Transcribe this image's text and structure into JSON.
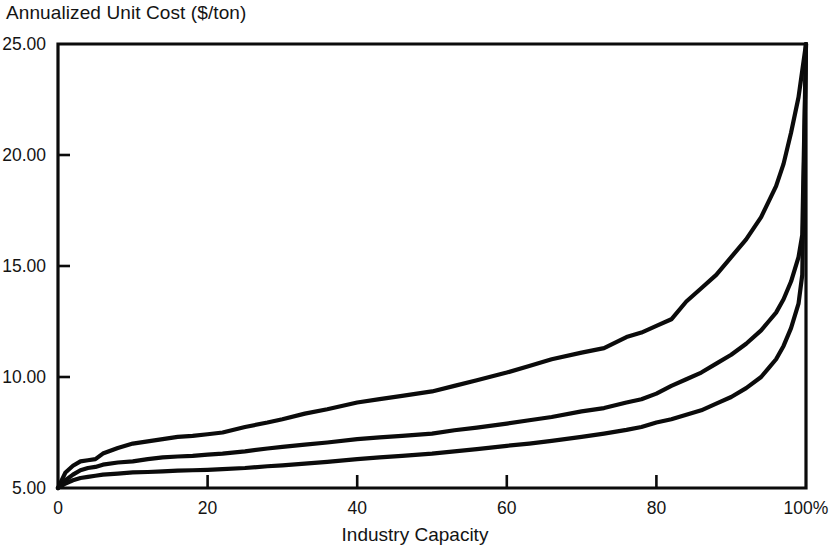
{
  "chart_data": {
    "type": "line",
    "title": "Annualized Unit Cost ($/ton)",
    "xlabel": "Industry Capacity",
    "ylabel": "Annualized Unit Cost ($/ton)",
    "xlim": [
      0,
      100
    ],
    "ylim": [
      5.0,
      25.0
    ],
    "grid": false,
    "legend_position": "none",
    "x_tick_labels": [
      "0",
      "20",
      "40",
      "60",
      "80",
      "100%"
    ],
    "x_tick_values": [
      0,
      20,
      40,
      60,
      80,
      100
    ],
    "y_tick_labels": [
      "5.00",
      "10.00",
      "15.00",
      "20.00",
      "25.00"
    ],
    "y_tick_values": [
      5.0,
      10.0,
      15.0,
      20.0,
      25.0
    ],
    "x": [
      0,
      1,
      2,
      3,
      4,
      5,
      6,
      8,
      10,
      12,
      14,
      16,
      18,
      20,
      22,
      25,
      28,
      30,
      33,
      36,
      40,
      43,
      46,
      50,
      53,
      56,
      60,
      63,
      66,
      70,
      73,
      76,
      78,
      80,
      82,
      84,
      86,
      88,
      90,
      92,
      94,
      95,
      96,
      97,
      98,
      99,
      99.5,
      100
    ],
    "series": [
      {
        "name": "upper-cost-curve",
        "values": [
          5.0,
          5.7,
          6.0,
          6.2,
          6.25,
          6.3,
          6.55,
          6.8,
          7.0,
          7.1,
          7.2,
          7.3,
          7.35,
          7.42,
          7.5,
          7.75,
          7.95,
          8.1,
          8.35,
          8.55,
          8.85,
          9.0,
          9.15,
          9.35,
          9.6,
          9.85,
          10.2,
          10.5,
          10.8,
          11.1,
          11.3,
          11.8,
          12.0,
          12.3,
          12.6,
          13.4,
          14.0,
          14.6,
          15.4,
          16.2,
          17.2,
          17.9,
          18.6,
          19.6,
          21.0,
          22.6,
          23.8,
          25.0
        ]
      },
      {
        "name": "middle-cost-curve",
        "values": [
          5.0,
          5.35,
          5.6,
          5.8,
          5.9,
          5.95,
          6.05,
          6.15,
          6.2,
          6.3,
          6.38,
          6.42,
          6.45,
          6.5,
          6.55,
          6.65,
          6.78,
          6.85,
          6.95,
          7.05,
          7.2,
          7.28,
          7.35,
          7.45,
          7.6,
          7.72,
          7.9,
          8.05,
          8.2,
          8.45,
          8.6,
          8.85,
          9.0,
          9.25,
          9.6,
          9.9,
          10.2,
          10.6,
          11.0,
          11.5,
          12.1,
          12.5,
          12.9,
          13.5,
          14.3,
          15.4,
          16.4,
          25.0
        ]
      },
      {
        "name": "lower-cost-curve",
        "values": [
          5.0,
          5.2,
          5.35,
          5.45,
          5.5,
          5.55,
          5.6,
          5.65,
          5.7,
          5.72,
          5.75,
          5.78,
          5.8,
          5.82,
          5.85,
          5.9,
          5.98,
          6.02,
          6.1,
          6.18,
          6.3,
          6.38,
          6.45,
          6.55,
          6.65,
          6.75,
          6.9,
          7.0,
          7.12,
          7.3,
          7.45,
          7.62,
          7.75,
          7.95,
          8.1,
          8.3,
          8.5,
          8.8,
          9.1,
          9.5,
          10.0,
          10.4,
          10.8,
          11.4,
          12.2,
          13.3,
          14.6,
          25.0
        ]
      }
    ]
  }
}
